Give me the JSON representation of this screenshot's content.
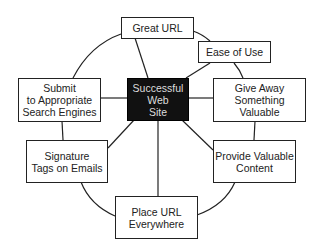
{
  "diagram": {
    "type": "hub-and-spoke with ring",
    "center": {
      "label": "Successful\nWeb\nSite"
    },
    "nodes": [
      {
        "id": "great-url",
        "label": "Great URL"
      },
      {
        "id": "ease-of-use",
        "label": "Ease of Use"
      },
      {
        "id": "give-away",
        "label": "Give Away\nSomething Valuable"
      },
      {
        "id": "provide-content",
        "label": "Provide Valuable\nContent"
      },
      {
        "id": "place-url",
        "label": "Place URL\nEverywhere"
      },
      {
        "id": "signature-tags",
        "label": "Signature\nTags on Emails"
      },
      {
        "id": "submit-search",
        "label": "Submit\nto Appropriate\nSearch Engines"
      }
    ],
    "colors": {
      "line": "#222222",
      "center_fill": "#111111",
      "center_text": "#dddddd",
      "node_fill": "#ffffff"
    }
  }
}
